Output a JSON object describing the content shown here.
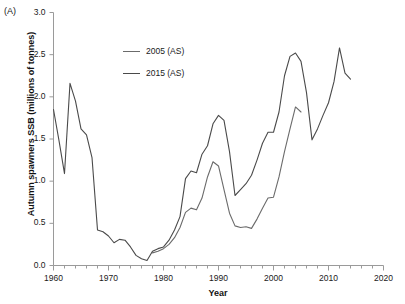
{
  "panel": {
    "label": "(A)"
  },
  "axes": {
    "y_title": "Autumn spawners SSB (millions of tonnes)",
    "x_title": "Year",
    "y_ticks": [
      "0.0",
      "0.5",
      "1.0",
      "1.5",
      "2.0",
      "2.5",
      "3.0"
    ],
    "x_ticks": [
      "1960",
      "1970",
      "1980",
      "1990",
      "2000",
      "2010",
      "2020"
    ]
  },
  "legend": {
    "items": [
      {
        "label": "2005 (AS)",
        "color": "#6b6b6b"
      },
      {
        "label": "2015 (AS)",
        "color": "#4a4a4a"
      }
    ]
  },
  "chart_data": {
    "type": "line",
    "title": "",
    "xlabel": "Year",
    "ylabel": "Autumn spawners SSB (millions of tonnes)",
    "xlim": [
      1960,
      2020
    ],
    "ylim": [
      0.0,
      3.0
    ],
    "ytick_values": [
      0.0,
      0.5,
      1.0,
      1.5,
      2.0,
      2.5,
      3.0
    ],
    "xtick_values": [
      1960,
      1970,
      1980,
      1990,
      2000,
      2010,
      2020
    ],
    "xminor_step": 2,
    "grid": false,
    "legend_position": "upper-left-inside",
    "series": [
      {
        "name": "2005 (AS)",
        "color": "#6b6b6b",
        "x": [
          1978,
          1979,
          1980,
          1981,
          1982,
          1983,
          1984,
          1985,
          1986,
          1987,
          1988,
          1989,
          1990,
          1991,
          1992,
          1993,
          1994,
          1995,
          1996,
          1997,
          1998,
          1999,
          2000,
          2001,
          2002,
          2003,
          2004,
          2005
        ],
        "values": [
          0.15,
          0.17,
          0.2,
          0.25,
          0.33,
          0.45,
          0.63,
          0.68,
          0.66,
          0.8,
          1.05,
          1.23,
          1.18,
          0.9,
          0.62,
          0.47,
          0.45,
          0.46,
          0.44,
          0.55,
          0.68,
          0.8,
          0.81,
          1.05,
          1.35,
          1.62,
          1.88,
          1.82
        ]
      },
      {
        "name": "2015 (AS)",
        "color": "#4a4a4a",
        "x": [
          1960,
          1961,
          1962,
          1963,
          1964,
          1965,
          1966,
          1967,
          1968,
          1969,
          1970,
          1971,
          1972,
          1973,
          1974,
          1975,
          1976,
          1977,
          1978,
          1979,
          1980,
          1981,
          1982,
          1983,
          1984,
          1985,
          1986,
          1987,
          1988,
          1989,
          1990,
          1991,
          1992,
          1993,
          1994,
          1995,
          1996,
          1997,
          1998,
          1999,
          2000,
          2001,
          2002,
          2003,
          2004,
          2005,
          2006,
          2007,
          2008,
          2009,
          2010,
          2011,
          2012,
          2013,
          2014
        ],
        "values": [
          1.85,
          1.48,
          1.09,
          2.16,
          1.95,
          1.62,
          1.55,
          1.28,
          0.42,
          0.4,
          0.35,
          0.27,
          0.31,
          0.3,
          0.22,
          0.12,
          0.08,
          0.06,
          0.17,
          0.2,
          0.22,
          0.3,
          0.42,
          0.58,
          1.03,
          1.12,
          1.1,
          1.32,
          1.42,
          1.68,
          1.78,
          1.72,
          1.35,
          0.83,
          0.9,
          0.97,
          1.07,
          1.25,
          1.45,
          1.58,
          1.58,
          1.82,
          2.25,
          2.48,
          2.52,
          2.42,
          2.05,
          1.49,
          1.62,
          1.78,
          1.93,
          2.18,
          2.58,
          2.28,
          2.21
        ]
      }
    ]
  }
}
